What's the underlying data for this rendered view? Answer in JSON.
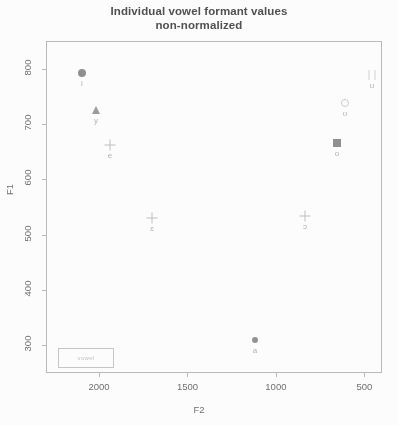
{
  "title": {
    "line1": "Individual vowel formant values",
    "line2": "non-normalized"
  },
  "axes": {
    "x_label": "F2",
    "y_label": "F1",
    "x_ticks": [
      "2000",
      "1500",
      "1000",
      "500"
    ],
    "y_ticks": [
      "300",
      "400",
      "500",
      "600",
      "700",
      "800"
    ]
  },
  "legend": {
    "text": "vowel"
  },
  "chart_data": {
    "type": "scatter",
    "title": "Individual vowel formant values non-normalized",
    "xlabel": "F2",
    "ylabel": "F1",
    "xlim": [
      2300,
      400
    ],
    "ylim": [
      850,
      250
    ],
    "x_reversed": true,
    "y_reversed": true,
    "grid": false,
    "legend_position": "bottom-left",
    "x_ticks": [
      2000,
      1500,
      1000,
      500
    ],
    "y_ticks": [
      300,
      400,
      500,
      600,
      700,
      800
    ],
    "points": [
      {
        "label": "i",
        "F2": 2240,
        "F1": 275,
        "marker": "circle-filled",
        "px": 36,
        "py": 32
      },
      {
        "label": "y",
        "F2": 2155,
        "F1": 355,
        "marker": "triangle-filled",
        "px": 50,
        "py": 69
      },
      {
        "label": "e",
        "F2": 2070,
        "F1": 420,
        "marker": "plus",
        "px": 64,
        "py": 104
      },
      {
        "label": "u",
        "F2": 500,
        "F1": 285,
        "marker": "bars",
        "px": 326,
        "py": 34
      },
      {
        "label": "ʊ",
        "F2": 665,
        "F1": 340,
        "marker": "open-circle",
        "px": 299,
        "py": 62
      },
      {
        "label": "o",
        "F2": 715,
        "F1": 415,
        "marker": "square-filled",
        "px": 291,
        "py": 102
      },
      {
        "label": "ɛ",
        "F2": 1820,
        "F1": 565,
        "marker": "cross",
        "px": 106,
        "py": 177
      },
      {
        "label": "ɔ",
        "F2": 900,
        "F1": 560,
        "marker": "cross",
        "px": 259,
        "py": 175
      },
      {
        "label": "a",
        "F2": 1200,
        "F1": 795,
        "marker": "point",
        "px": 209,
        "py": 299
      }
    ]
  }
}
